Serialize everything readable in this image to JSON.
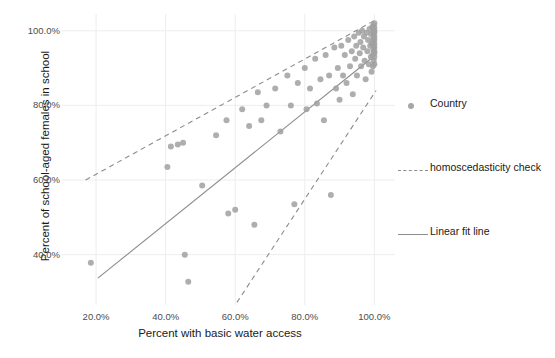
{
  "chart_data": {
    "type": "scatter",
    "title": "",
    "xlabel": "Percent with basic water access",
    "ylabel": "Percent of school-aged females in school",
    "xlim": [
      0.125,
      1.045
    ],
    "ylim": [
      0.265,
      1.045
    ],
    "xticks": [
      0.2,
      0.4,
      0.6,
      0.8,
      1.0
    ],
    "xticklabels": [
      "20.0%",
      "40.0%",
      "60.0%",
      "80.0%",
      "100.0%"
    ],
    "yticks": [
      0.4,
      0.6,
      0.8,
      1.0
    ],
    "yticklabels": [
      "40.0%",
      "60.0%",
      "80.0%",
      "100.0%"
    ],
    "grid": true,
    "legend_position": "right",
    "point_color": "#a0a0a0",
    "line_color": "#8c8c8c",
    "series": [
      {
        "name": "Country",
        "type": "scatter",
        "points": [
          [
            0.185,
            0.378
          ],
          [
            0.405,
            0.635
          ],
          [
            0.415,
            0.69
          ],
          [
            0.435,
            0.695
          ],
          [
            0.455,
            0.4
          ],
          [
            0.45,
            0.7
          ],
          [
            0.465,
            0.327
          ],
          [
            0.505,
            0.585
          ],
          [
            0.545,
            0.72
          ],
          [
            0.575,
            0.76
          ],
          [
            0.58,
            0.51
          ],
          [
            0.6,
            0.52
          ],
          [
            0.62,
            0.79
          ],
          [
            0.64,
            0.745
          ],
          [
            0.655,
            0.48
          ],
          [
            0.665,
            0.835
          ],
          [
            0.675,
            0.76
          ],
          [
            0.69,
            0.8
          ],
          [
            0.715,
            0.845
          ],
          [
            0.73,
            0.73
          ],
          [
            0.75,
            0.88
          ],
          [
            0.76,
            0.8
          ],
          [
            0.77,
            0.535
          ],
          [
            0.78,
            0.86
          ],
          [
            0.8,
            0.9
          ],
          [
            0.805,
            0.79
          ],
          [
            0.815,
            0.845
          ],
          [
            0.83,
            0.925
          ],
          [
            0.835,
            0.805
          ],
          [
            0.845,
            0.87
          ],
          [
            0.855,
            0.76
          ],
          [
            0.86,
            0.935
          ],
          [
            0.87,
            0.88
          ],
          [
            0.875,
            0.56
          ],
          [
            0.885,
            0.955
          ],
          [
            0.89,
            0.845
          ],
          [
            0.895,
            0.9
          ],
          [
            0.9,
            0.815
          ],
          [
            0.905,
            0.96
          ],
          [
            0.91,
            0.88
          ],
          [
            0.915,
            0.935
          ],
          [
            0.92,
            0.86
          ],
          [
            0.925,
            0.975
          ],
          [
            0.93,
            0.905
          ],
          [
            0.935,
            0.945
          ],
          [
            0.938,
            0.83
          ],
          [
            0.942,
            0.985
          ],
          [
            0.945,
            0.925
          ],
          [
            0.948,
            0.96
          ],
          [
            0.95,
            0.88
          ],
          [
            0.955,
            0.995
          ],
          [
            0.958,
            0.94
          ],
          [
            0.96,
            0.97
          ],
          [
            0.962,
            0.905
          ],
          [
            0.965,
            1.0
          ],
          [
            0.968,
            0.955
          ],
          [
            0.97,
            0.985
          ],
          [
            0.972,
            0.92
          ],
          [
            0.975,
            0.87
          ],
          [
            0.978,
            0.995
          ],
          [
            0.98,
            0.945
          ],
          [
            0.982,
            0.975
          ],
          [
            0.984,
            0.91
          ],
          [
            0.986,
            1.005
          ],
          [
            0.988,
            0.96
          ],
          [
            0.99,
            0.93
          ],
          [
            0.991,
            0.99
          ],
          [
            0.992,
            0.89
          ],
          [
            0.993,
            0.965
          ],
          [
            0.994,
            1.01
          ],
          [
            0.995,
            0.935
          ],
          [
            0.996,
            0.975
          ],
          [
            0.996,
            0.905
          ],
          [
            0.997,
            0.995
          ],
          [
            0.997,
            0.95
          ],
          [
            0.998,
            1.015
          ],
          [
            0.998,
            0.92
          ],
          [
            0.999,
            0.98
          ],
          [
            0.999,
            0.96
          ],
          [
            1.0,
            1.0
          ],
          [
            1.0,
            0.94
          ],
          [
            1.0,
            0.985
          ],
          [
            1.0,
            0.965
          ],
          [
            1.0,
            1.02
          ],
          [
            1.0,
            0.91
          ],
          [
            1.0,
            0.93
          ],
          [
            1.0,
            0.955
          ],
          [
            1.0,
            0.995
          ],
          [
            1.0,
            0.975
          ],
          [
            1.0,
            1.008
          ],
          [
            1.0,
            0.945
          ]
        ]
      },
      {
        "name": "homoscedasticity check",
        "type": "line",
        "style": "dashed",
        "segments": [
          [
            [
              0.17,
              0.6
            ],
            [
              1.005,
              1.03
            ]
          ],
          [
            [
              0.605,
              0.272
            ],
            [
              1.005,
              0.84
            ]
          ]
        ]
      },
      {
        "name": "Linear fit line",
        "type": "line",
        "style": "solid",
        "segments": [
          [
            [
              0.205,
              0.337
            ],
            [
              0.99,
              0.925
            ]
          ]
        ]
      }
    ]
  },
  "legend": {
    "entries": [
      {
        "label": "Country",
        "key": "dot"
      },
      {
        "label": "homoscedasticity check",
        "key": "dash"
      },
      {
        "label": "Linear fit line",
        "key": "line"
      }
    ]
  }
}
